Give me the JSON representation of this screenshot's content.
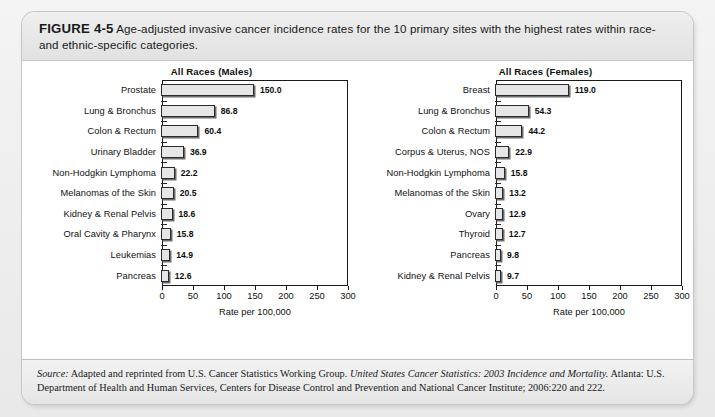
{
  "figure": {
    "label": "FIGURE 4-5",
    "caption": "Age-adjusted invasive cancer incidence rates for the 10 primary sites with the highest rates within race- and ethnic-specific categories."
  },
  "source": {
    "prefix": "Source:",
    "part1": " Adapted and reprinted from U.S. Cancer Statistics Working Group. ",
    "italic_title": "United States Cancer Statistics: 2003 Incidence and Mortality.",
    "part2": " Atlanta: U.S. Department of Health and Human Services, Centers for Disease Control and Prevention and National Cancer Institute; 2006:220 and 222."
  },
  "chart_data": [
    {
      "type": "bar",
      "orientation": "horizontal",
      "title": "All Races (Males)",
      "xlabel": "Rate per 100,000",
      "ylabel": "",
      "xlim": [
        0,
        300
      ],
      "xticks": [
        0,
        50,
        100,
        150,
        200,
        250,
        300
      ],
      "grid": false,
      "legend": false,
      "categories": [
        "Prostate",
        "Lung & Bronchus",
        "Colon & Rectum",
        "Urinary Bladder",
        "Non-Hodgkin Lymphoma",
        "Melanomas of the Skin",
        "Kidney & Renal Pelvis",
        "Oral Cavity & Pharynx",
        "Leukemias",
        "Pancreas"
      ],
      "values": [
        150.0,
        86.8,
        60.4,
        36.9,
        22.2,
        20.5,
        18.6,
        15.8,
        14.9,
        12.6
      ],
      "value_labels": [
        "150.0",
        "86.8",
        "60.4",
        "36.9",
        "22.2",
        "20.5",
        "18.6",
        "15.8",
        "14.9",
        "12.6"
      ]
    },
    {
      "type": "bar",
      "orientation": "horizontal",
      "title": "All Races (Females)",
      "xlabel": "Rate per 100,000",
      "ylabel": "",
      "xlim": [
        0,
        300
      ],
      "xticks": [
        0,
        50,
        100,
        150,
        200,
        250,
        300
      ],
      "grid": false,
      "legend": false,
      "categories": [
        "Breast",
        "Lung & Bronchus",
        "Colon & Rectum",
        "Corpus & Uterus, NOS",
        "Non-Hodgkin Lymphoma",
        "Melanomas of the Skin",
        "Ovary",
        "Thyroid",
        "Pancreas",
        "Kidney & Renal Pelvis"
      ],
      "values": [
        119.0,
        54.3,
        44.2,
        22.9,
        15.8,
        13.2,
        12.9,
        12.7,
        9.8,
        9.7
      ],
      "value_labels": [
        "119.0",
        "54.3",
        "44.2",
        "22.9",
        "15.8",
        "13.2",
        "12.9",
        "12.7",
        "9.8",
        "9.7"
      ]
    }
  ],
  "colors": {
    "bar_fill": "#e6e6e6",
    "bar_border": "#2b2b2b",
    "bar_shadow": "#6d6d6d",
    "card_bg": "#ffffff",
    "band_bg": "#ebebeb"
  }
}
